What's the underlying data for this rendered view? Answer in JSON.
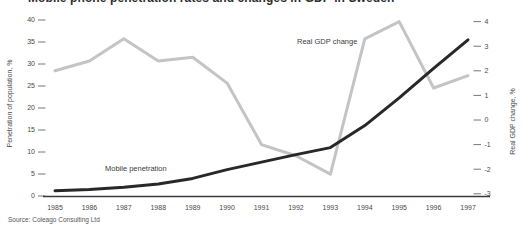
{
  "title": {
    "text": "Mobile phone penetration rates and changes in GDP in Sweden"
  },
  "source": "Source: Coleago Consulting Ltd",
  "colors": {
    "mobile_line": "#282828",
    "gdp_line": "#c4c4c4",
    "axis_line": "#3a3a3a",
    "tick": "#777777",
    "text": "#4a4a4a",
    "background": "#ffffff"
  },
  "chart_data": {
    "type": "line",
    "x": [
      1985,
      1986,
      1987,
      1988,
      1989,
      1990,
      1991,
      1992,
      1993,
      1994,
      1995,
      1996,
      1997
    ],
    "series": [
      {
        "name": "Mobile penetration",
        "axis": "left",
        "color": "#282828",
        "values": [
          1.2,
          1.5,
          2.0,
          2.7,
          4.0,
          6.0,
          7.7,
          9.4,
          11.0,
          16.0,
          22.3,
          29.0,
          35.5
        ]
      },
      {
        "name": "Real GDP change",
        "axis": "right",
        "color": "#c4c4c4",
        "values": [
          2.0,
          2.4,
          3.3,
          2.4,
          2.55,
          1.5,
          -1.0,
          -1.45,
          -2.2,
          3.3,
          4.0,
          1.3,
          1.8
        ]
      }
    ],
    "left_axis": {
      "label": "Penetration of population, %",
      "ticks": [
        40,
        35,
        30,
        25,
        20,
        15,
        10,
        5,
        0
      ],
      "range": [
        0,
        40
      ]
    },
    "right_axis": {
      "label": "Real GDP change, %",
      "ticks": [
        4,
        3,
        2,
        1,
        0,
        -1,
        -2,
        -3
      ],
      "range": [
        -3,
        4
      ]
    },
    "grid": false,
    "legend": "inline-labels"
  }
}
